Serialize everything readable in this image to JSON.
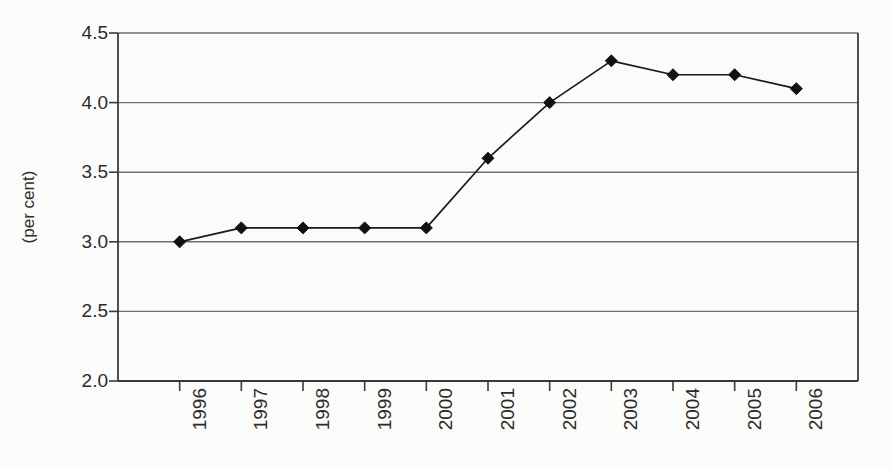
{
  "chart_data": {
    "type": "line",
    "title": "",
    "subtitle": "",
    "xlabel": "",
    "ylabel": "(per cent)",
    "categories": [
      "1996",
      "1997",
      "1998",
      "1999",
      "2000",
      "2001",
      "2002",
      "2003",
      "2004",
      "2005",
      "2006"
    ],
    "values": [
      3.0,
      3.1,
      3.1,
      3.1,
      3.1,
      3.6,
      4.0,
      4.3,
      4.2,
      4.2,
      4.1
    ],
    "series": [
      {
        "name": "",
        "values": [
          3.0,
          3.1,
          3.1,
          3.1,
          3.1,
          3.6,
          4.0,
          4.3,
          4.2,
          4.2,
          4.1
        ]
      }
    ],
    "ylim": [
      2.0,
      4.5
    ],
    "yticks": [
      "2.0",
      "2.5",
      "3.0",
      "3.5",
      "4.0",
      "4.5"
    ],
    "ytick_values": [
      2.0,
      2.5,
      3.0,
      3.5,
      4.0,
      4.5
    ],
    "xtick_rotation": 90,
    "grid": "horizontal",
    "legend": "none",
    "marker": "diamond",
    "line_color": "#1a1a1a",
    "marker_color": "#111111",
    "grid_color": "#6e6e6e",
    "axis_color": "#3a3a3a",
    "background_color": "#fbfbfa"
  },
  "figure": {
    "plot_left": 118,
    "plot_right": 858,
    "plot_top": 33,
    "plot_bottom": 381
  }
}
